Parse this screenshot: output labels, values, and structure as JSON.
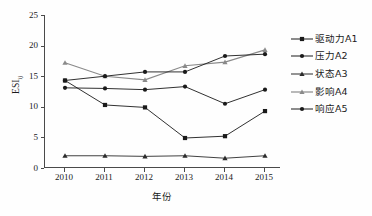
{
  "chart_data": {
    "type": "line",
    "title": "",
    "xlabel": "年份",
    "ylabel": "ESI",
    "ylabel_sub": "ij",
    "categories": [
      "2010",
      "2011",
      "2012",
      "2013",
      "2014",
      "2015"
    ],
    "x": [
      2010,
      2011,
      2012,
      2013,
      2014,
      2015
    ],
    "ylim": [
      0,
      25
    ],
    "xlim": [
      2009.6,
      2015.6
    ],
    "yticks": [
      0,
      5,
      10,
      15,
      20,
      25
    ],
    "ytick_labels": [
      "0",
      "5",
      "10",
      "15",
      "20",
      "25"
    ],
    "grid": false,
    "legend_position": "right",
    "series": [
      {
        "name": "驱动力A1",
        "marker": "square",
        "color": "#1a1a1a",
        "values": [
          14.3,
          10.3,
          9.9,
          4.9,
          5.2,
          9.3
        ]
      },
      {
        "name": "压力A2",
        "marker": "circle",
        "color": "#1a1a1a",
        "values": [
          13.1,
          13.0,
          12.8,
          13.3,
          10.5,
          12.8
        ]
      },
      {
        "name": "状态A3",
        "marker": "triangle",
        "color": "#2b2b2b",
        "values": [
          2.0,
          2.0,
          1.9,
          2.0,
          1.6,
          2.0
        ]
      },
      {
        "name": "影响A4",
        "marker": "triangle",
        "color": "#8a8a8a",
        "values": [
          17.2,
          15.0,
          14.4,
          16.7,
          17.3,
          19.3
        ]
      },
      {
        "name": "响应A5",
        "marker": "circle",
        "color": "#1a1a1a",
        "values": [
          14.3,
          15.0,
          15.7,
          15.7,
          18.3,
          18.6
        ]
      }
    ]
  },
  "axes": {
    "x_title": "年份",
    "y_title": "ESI",
    "y_title_sub": "ij"
  },
  "legend": {
    "items": [
      {
        "label": "驱动力A1"
      },
      {
        "label": "压力A2"
      },
      {
        "label": "状态A3"
      },
      {
        "label": "影响A4"
      },
      {
        "label": "响应A5"
      }
    ]
  }
}
